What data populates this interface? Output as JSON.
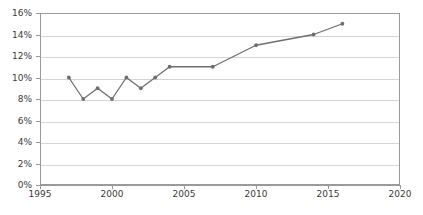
{
  "chart_data": {
    "type": "line",
    "title": "",
    "subtitle": "",
    "xlabel": "",
    "ylabel": "",
    "xlim": [
      1995,
      2020
    ],
    "ylim": [
      0,
      16
    ],
    "grid": true,
    "legend": false,
    "legend_position": "none",
    "series_color": "#6e6e6e",
    "gridline_color": "#d4d4d4",
    "axis_color": "#9a9a9a",
    "x": [
      1997,
      1998,
      1999,
      2000,
      2001,
      2002,
      2003,
      2004,
      2007,
      2010,
      2014,
      2016
    ],
    "values": [
      10,
      8,
      9,
      8,
      10,
      9,
      10,
      11,
      11,
      13,
      14,
      15
    ],
    "x_ticks": [
      1995,
      2000,
      2005,
      2010,
      2015,
      2020
    ],
    "x_tick_labels": [
      "1995",
      "2000",
      "2005",
      "2010",
      "2015",
      "2020"
    ],
    "y_ticks": [
      0,
      2,
      4,
      6,
      8,
      10,
      12,
      14,
      16
    ],
    "y_tick_labels": [
      "0%",
      "2%",
      "4%",
      "6%",
      "8%",
      "10%",
      "12%",
      "14%",
      "16%"
    ],
    "annotations": [],
    "points": [
      {
        "x": 1997,
        "y": 10,
        "label": "10%"
      },
      {
        "x": 1998,
        "y": 8,
        "label": "8%"
      },
      {
        "x": 1999,
        "y": 9,
        "label": "9%"
      },
      {
        "x": 2000,
        "y": 8,
        "label": "8%"
      },
      {
        "x": 2001,
        "y": 10,
        "label": "10%"
      },
      {
        "x": 2002,
        "y": 9,
        "label": "9%"
      },
      {
        "x": 2003,
        "y": 10,
        "label": "10%"
      },
      {
        "x": 2004,
        "y": 11,
        "label": "11%"
      },
      {
        "x": 2007,
        "y": 11,
        "label": "11%"
      },
      {
        "x": 2010,
        "y": 13,
        "label": "13%"
      },
      {
        "x": 2014,
        "y": 14,
        "label": "14%"
      },
      {
        "x": 2016,
        "y": 15,
        "label": "15%"
      }
    ]
  }
}
